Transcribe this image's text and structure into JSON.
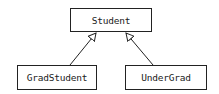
{
  "diagram": {
    "type": "uml-class-inheritance",
    "colors": {
      "stroke": "#222222",
      "fill": "#ffffff",
      "text": "#222222"
    },
    "nodes": [
      {
        "id": "student",
        "label": "Student"
      },
      {
        "id": "gradstudent",
        "label": "GradStudent"
      },
      {
        "id": "undergrad",
        "label": "UnderGrad"
      }
    ],
    "edges": [
      {
        "from": "gradstudent",
        "to": "student",
        "kind": "generalization"
      },
      {
        "from": "undergrad",
        "to": "student",
        "kind": "generalization"
      }
    ]
  }
}
